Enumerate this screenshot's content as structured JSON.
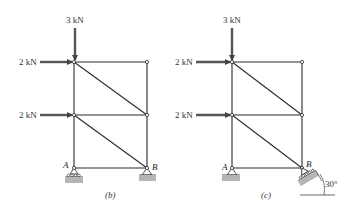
{
  "diagrams": [
    {
      "id": "b",
      "caption": "(b)",
      "loads": {
        "top_vertical": "3 kN",
        "top_horizontal": "2 kN",
        "mid_horizontal": "2 kN"
      },
      "nodes": {
        "left_support": "A",
        "right_support": "B"
      },
      "supports": {
        "A": "roller",
        "B": "pin"
      }
    },
    {
      "id": "c",
      "caption": "(c)",
      "loads": {
        "top_vertical": "3 kN",
        "top_horizontal": "2 kN",
        "mid_horizontal": "2 kN"
      },
      "nodes": {
        "left_support": "A",
        "right_support": "B"
      },
      "supports": {
        "A": "pin",
        "B": "inclined roller"
      },
      "angle_label": "30°"
    }
  ],
  "colors": {
    "member": "#2a2a2a",
    "arrow": "#555555",
    "ground": "#b5b5b5"
  }
}
